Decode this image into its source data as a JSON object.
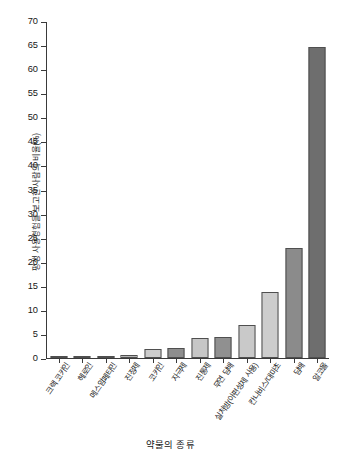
{
  "chart_data": {
    "type": "bar",
    "title": "",
    "xlabel": "약물의 종류",
    "ylabel": "평생 사용경험을 보고한 사람의 비율(%)",
    "ylim": [
      0,
      70
    ],
    "ytick_step": 5,
    "grid": false,
    "legend": null,
    "yticks": [
      "0",
      "5",
      "10",
      "15",
      "20",
      "25",
      "30",
      "35",
      "40",
      "45",
      "50",
      "55",
      "60",
      "65",
      "70"
    ],
    "categories": [
      "크랙 코카인",
      "헤로인",
      "메스암페타민",
      "진정제",
      "코카인",
      "자극제",
      "진통제",
      "무연 담배",
      "실처방(아편성제 사용)",
      "칸나비스/대마초",
      "담배",
      "알코올"
    ],
    "values": [
      0.2,
      0.4,
      0.5,
      0.6,
      1.9,
      2.1,
      4.2,
      4.4,
      6.8,
      13.8,
      22.9,
      64.7
    ],
    "bar_colors": [
      "#a8a8a8",
      "#cbcbcb",
      "#8d8d8d",
      "#b5b5b5",
      "#cccccc",
      "#8e8e8e",
      "#c6c6c6",
      "#909090",
      "#c9c9c9",
      "#cdcdcd",
      "#8b8b8b",
      "#6e6e6e"
    ]
  },
  "axis_style": {
    "axis_color": "#3a3a3a",
    "bar_border": "#4f4f4f",
    "text_color": "#161616"
  }
}
